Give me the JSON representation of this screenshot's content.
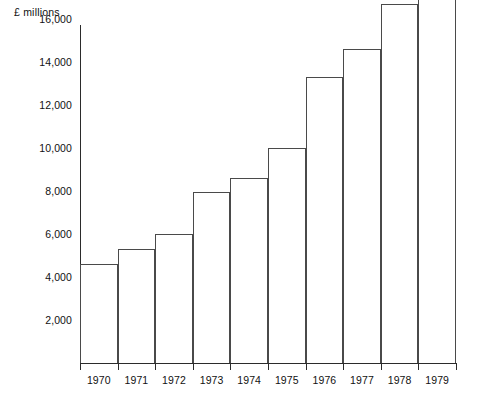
{
  "chart_data": {
    "type": "bar",
    "title": "",
    "subtitle": "",
    "xlabel": "",
    "ylabel": "£ millions",
    "categories": [
      "1970",
      "1971",
      "1972",
      "1973",
      "1974",
      "1975",
      "1976",
      "1977",
      "1978",
      "1979"
    ],
    "values": [
      4600,
      5300,
      6000,
      7950,
      8600,
      10000,
      13300,
      14600,
      16700,
      18700
    ],
    "ylim": [
      0,
      19500
    ],
    "ytick_values": [
      2000,
      4000,
      6000,
      8000,
      10000,
      12000,
      14000,
      16000,
      18000
    ],
    "ytick_labels": [
      "2,000",
      "4,000",
      "6,000",
      "8,000",
      "10,000",
      "12,000",
      "14,000",
      "16,000",
      "18,000"
    ],
    "grid": false,
    "legend": null,
    "bar_style": {
      "fill": "#ffffff",
      "outline": "#4a4a4a",
      "gap": "none"
    },
    "axis_color": "#2b2b2b",
    "background": "#ffffff"
  }
}
